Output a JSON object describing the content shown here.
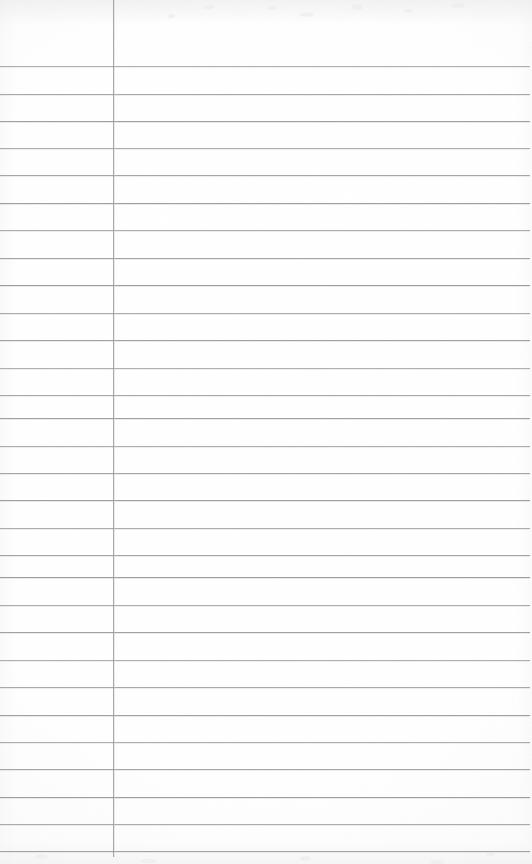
{
  "document": {
    "kind": "scanned-page",
    "title": "Blank ruled notebook page",
    "description": "Scanned blank lined ledger / notebook sheet with horizontal ruled lines and a single vertical margin rule",
    "text_content": "",
    "page_number": "",
    "heading": "",
    "body_text": "",
    "notes": ""
  },
  "page": {
    "width": 532,
    "height": 864,
    "background_color": "#fdfdfd",
    "paper_tint": "#ffffff"
  },
  "ruling": {
    "line_color": "#8d9096",
    "line_secondary_color": "#c9cbd0",
    "line_thickness": 1,
    "line_spacing": 27.5,
    "first_line_y": 66,
    "line_left": 0,
    "line_right": 530,
    "horizontal_line_count": 29,
    "horizontal_lines_y": [
      66,
      93.5,
      120.5,
      147.5,
      175,
      202.5,
      230,
      257.5,
      285,
      312.5,
      340,
      367.5,
      395,
      418,
      445.5,
      472.5,
      500,
      527.5,
      555,
      577,
      604.5,
      632,
      659.5,
      687,
      714.5,
      741.5,
      769,
      796.5,
      824,
      850.5
    ]
  },
  "margin_rule": {
    "label": "vertical-margin-rule",
    "color": "#909399",
    "x": 113,
    "top": 0,
    "bottom": 857,
    "thickness": 1
  },
  "texture": {
    "top_shadow_color": "#e8e8ea",
    "bottom_shadow_color": "#eeeef0",
    "edge_shadow_color": "#f6f6f7",
    "speck_color": "#e9e9ec"
  },
  "specks": [
    {
      "x": 268,
      "y": 6,
      "w": 9,
      "h": 4
    },
    {
      "x": 300,
      "y": 12,
      "w": 14,
      "h": 5
    },
    {
      "x": 352,
      "y": 4,
      "w": 11,
      "h": 6
    },
    {
      "x": 404,
      "y": 9,
      "w": 8,
      "h": 4
    },
    {
      "x": 452,
      "y": 3,
      "w": 13,
      "h": 5
    },
    {
      "x": 168,
      "y": 14,
      "w": 7,
      "h": 4
    },
    {
      "x": 204,
      "y": 5,
      "w": 10,
      "h": 4
    },
    {
      "x": 36,
      "y": 854,
      "w": 12,
      "h": 5
    },
    {
      "x": 140,
      "y": 859,
      "w": 16,
      "h": 4
    },
    {
      "x": 300,
      "y": 856,
      "w": 10,
      "h": 5
    },
    {
      "x": 430,
      "y": 860,
      "w": 14,
      "h": 4
    },
    {
      "x": 486,
      "y": 852,
      "w": 9,
      "h": 4
    }
  ]
}
